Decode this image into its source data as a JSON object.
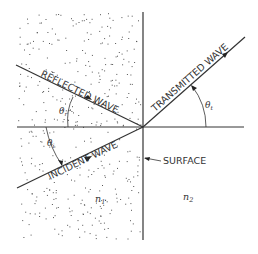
{
  "diagram": {
    "colors": {
      "background": "#ffffff",
      "line": "#333333",
      "dots": "#555555"
    },
    "labels": {
      "reflected_wave": "REFLECTED WAVE",
      "incident_wave": "INCIDENT WAVE",
      "transmitted_wave": "TRANSMITTED WAVE",
      "surface": "SURFACE",
      "medium1": "n",
      "medium1_sub": "1",
      "medium2": "n",
      "medium2_sub": "2",
      "theta_r": "θ",
      "theta_r_sub": "r",
      "theta_i": "θ",
      "theta_i_sub": "i",
      "theta_t": "θ",
      "theta_t_sub": "t"
    }
  }
}
